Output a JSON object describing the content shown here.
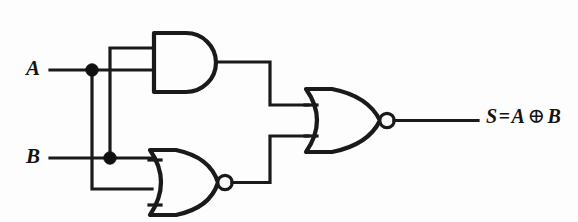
{
  "figure": {
    "kind": "logic-circuit-diagram",
    "background_color": "#fdfdfd",
    "ink_color": "#1a1a1a"
  },
  "inputs": [
    {
      "id": "A",
      "label": "A",
      "y": 70
    },
    {
      "id": "B",
      "label": "B",
      "y": 158
    }
  ],
  "gates": [
    {
      "id": "and1",
      "type": "AND",
      "name": "and-gate",
      "inverted_output": false,
      "inputs": [
        "B",
        "A"
      ],
      "x": 152,
      "y": 32,
      "width": 70,
      "height": 60
    },
    {
      "id": "nor1",
      "type": "NOR",
      "name": "nor-gate-lower",
      "inverted_output": true,
      "inputs": [
        "B",
        "A"
      ],
      "x": 152,
      "y": 148,
      "width": 66,
      "height": 69
    },
    {
      "id": "nor2",
      "type": "NOR",
      "name": "nor-gate-output",
      "inverted_output": true,
      "inputs": [
        "and1",
        "nor1"
      ],
      "x": 308,
      "y": 88,
      "width": 72,
      "height": 64
    }
  ],
  "junctions": [
    {
      "id": "junction-a",
      "on": "A",
      "x": 92,
      "y": 70
    },
    {
      "id": "junction-b",
      "on": "B",
      "x": 110,
      "y": 158
    }
  ],
  "output": {
    "id": "S",
    "signal_label": "S",
    "equals": "=",
    "operand_left": "A",
    "operator": "⊕",
    "operand_right": "B",
    "expression": "S = A ⊕ B"
  }
}
